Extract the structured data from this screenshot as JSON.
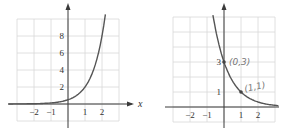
{
  "chart_data": [
    {
      "type": "line",
      "title": "",
      "xlabel": "x",
      "ylabel": "",
      "xlim": [
        -3,
        3
      ],
      "ylim": [
        -2,
        10
      ],
      "grid": true,
      "x_ticks": [
        "-2",
        "-1",
        "1",
        "2"
      ],
      "y_ticks": [
        "2",
        "4",
        "6",
        "8"
      ],
      "series": [
        {
          "name": "increasing exponential",
          "function": "0.5*4^x",
          "points": [
            [
              -3,
              0.008
            ],
            [
              -2,
              0.03
            ],
            [
              -1,
              0.125
            ],
            [
              0,
              0.5
            ],
            [
              1,
              2
            ],
            [
              2,
              8
            ],
            [
              2.2,
              10.5
            ]
          ]
        }
      ]
    },
    {
      "type": "line",
      "title": "",
      "xlabel": "",
      "ylabel": "",
      "xlim": [
        -3,
        3
      ],
      "ylim": [
        -1,
        6
      ],
      "grid": true,
      "x_ticks": [
        "-2",
        "-1",
        "1",
        "2"
      ],
      "y_ticks": [
        "1",
        "3"
      ],
      "series": [
        {
          "name": "decreasing exponential",
          "function": "3*(1/3)^x",
          "points": [
            [
              -0.7,
              6.6
            ],
            [
              0,
              3
            ],
            [
              1,
              1
            ],
            [
              2,
              0.333
            ],
            [
              3,
              0.111
            ]
          ]
        }
      ],
      "annotations": [
        {
          "point": [
            0,
            3
          ],
          "text": "(0,3)"
        },
        {
          "point": [
            1,
            1
          ],
          "text": "(1,1)"
        }
      ]
    }
  ],
  "labels": {
    "left_x_axis": "x",
    "left_ticks_x": [
      "−2",
      "−1",
      "1",
      "2"
    ],
    "left_ticks_y": [
      "2",
      "4",
      "6",
      "8"
    ],
    "right_ticks_x": [
      "−2",
      "−1",
      "1",
      "2"
    ],
    "right_ticks_y": [
      "1",
      "3"
    ],
    "annot_1": "(0,3)",
    "annot_2": "(1,1)"
  }
}
